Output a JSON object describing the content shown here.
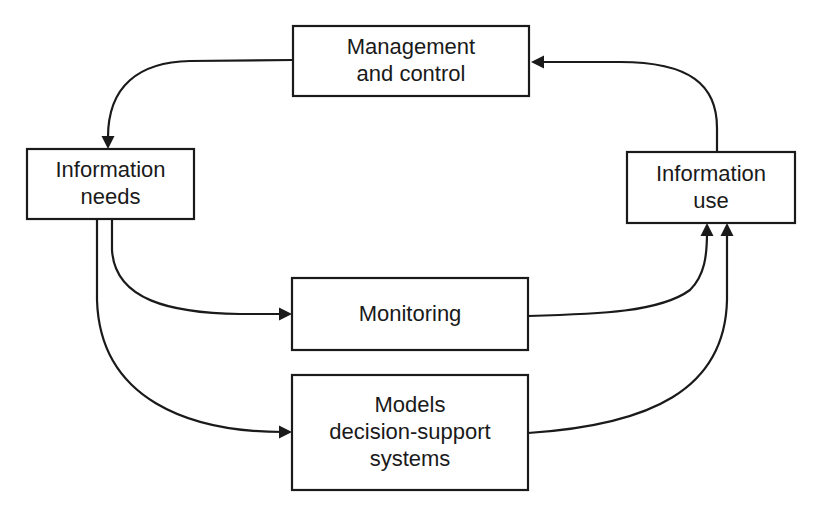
{
  "diagram": {
    "colors": {
      "stroke": "#1a1a1a",
      "background": "#ffffff"
    },
    "nodes": [
      {
        "id": "management",
        "name": "management-and-control-box",
        "x": 293,
        "y": 26,
        "w": 236,
        "h": 70,
        "lines": [
          "Management",
          "and control"
        ]
      },
      {
        "id": "needs",
        "name": "information-needs-box",
        "x": 27,
        "y": 149,
        "w": 167,
        "h": 70,
        "lines": [
          "Information",
          "needs"
        ]
      },
      {
        "id": "use",
        "name": "information-use-box",
        "x": 627,
        "y": 152,
        "w": 168,
        "h": 71,
        "lines": [
          "Information",
          "use"
        ]
      },
      {
        "id": "monitoring",
        "name": "monitoring-box",
        "x": 292,
        "y": 278,
        "w": 236,
        "h": 72,
        "lines": [
          "Monitoring"
        ]
      },
      {
        "id": "models",
        "name": "models-decision-support-box",
        "x": 292,
        "y": 375,
        "w": 236,
        "h": 115,
        "lines": [
          "Models",
          "decision-support",
          "systems"
        ]
      }
    ],
    "edges": [
      {
        "name": "edge-management-to-needs",
        "from": "management",
        "to": "needs",
        "path": "M 293 60 L 190 61 C 140 62 107 85 108 140",
        "head": [
          108,
          149,
          "down"
        ]
      },
      {
        "name": "edge-use-to-management",
        "from": "use",
        "to": "management",
        "path": "M 717 152 L 717 128 C 717 85 690 62 620 62 L 540 62",
        "head": [
          531,
          62,
          "left"
        ]
      },
      {
        "name": "edge-needs-to-monitoring",
        "from": "needs",
        "to": "monitoring",
        "path": "M 112 219 L 112 250 C 115 300 170 313 240 314 L 283 314",
        "head": [
          292,
          314,
          "right"
        ]
      },
      {
        "name": "edge-needs-to-models",
        "from": "needs",
        "to": "models",
        "path": "M 97 219 L 97 300 C 100 400 190 432 283 432",
        "head": [
          292,
          432,
          "right"
        ]
      },
      {
        "name": "edge-monitoring-to-use",
        "from": "monitoring",
        "to": "use",
        "path": "M 528 316 C 600 314 660 312 690 290 C 705 275 707 255 707 232",
        "head": [
          707,
          223,
          "up"
        ]
      },
      {
        "name": "edge-models-to-use",
        "from": "models",
        "to": "use",
        "path": "M 528 433 C 650 425 725 390 727 300 L 727 232",
        "head": [
          727,
          223,
          "up"
        ]
      }
    ]
  }
}
